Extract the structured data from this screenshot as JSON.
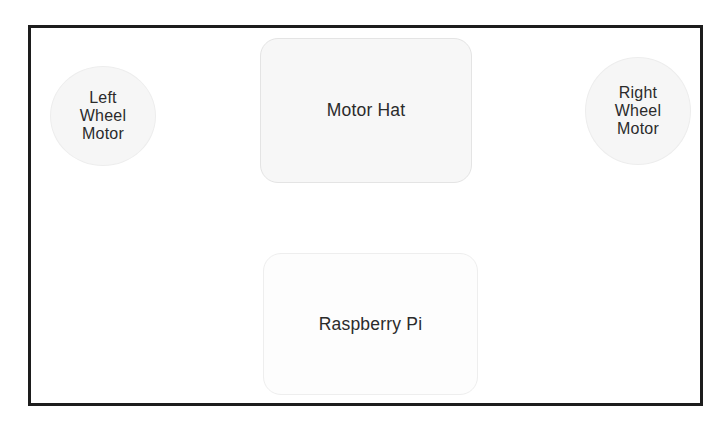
{
  "diagram": {
    "background_color": "#ffffff",
    "frame_color": "#1d1d1d",
    "nodes": [
      {
        "id": "left-wheel-motor",
        "label": "Left\nWheel\nMotor",
        "shape": "ellipse",
        "fill": "#f6f6f6",
        "stroke": "#ededed",
        "text_color": "#2b2b2b"
      },
      {
        "id": "motor-hat",
        "label": "Motor Hat",
        "shape": "rounded-rectangle",
        "fill": "#f7f7f7",
        "stroke": "#e4e4e4",
        "text_color": "#2b2b2b"
      },
      {
        "id": "right-wheel-motor",
        "label": "Right\nWheel\nMotor",
        "shape": "ellipse",
        "fill": "#f6f6f6",
        "stroke": "#ededed",
        "text_color": "#2b2b2b"
      },
      {
        "id": "raspberry-pi",
        "label": "Raspberry Pi",
        "shape": "rounded-rectangle",
        "fill": "#fdfdfd",
        "stroke": "#eeeeee",
        "text_color": "#2b2b2b"
      }
    ],
    "edges": [
      {
        "id": "motor-hat-to-left-wheel-motor",
        "from": "motor-hat",
        "to": "left-wheel-motor",
        "direction": "left",
        "style": "block-arrow",
        "fill": "#c9c9c9",
        "stroke": "#9a9a9a"
      },
      {
        "id": "motor-hat-to-right-wheel-motor",
        "from": "motor-hat",
        "to": "right-wheel-motor",
        "direction": "right",
        "style": "block-arrow",
        "fill": "#c9c9c9",
        "stroke": "#9a9a9a"
      },
      {
        "id": "raspberry-pi-to-motor-hat",
        "from": "raspberry-pi",
        "to": "motor-hat",
        "direction": "up",
        "style": "block-arrow",
        "fill": "#c9c9c9",
        "stroke": "#9a9a9a"
      }
    ]
  }
}
